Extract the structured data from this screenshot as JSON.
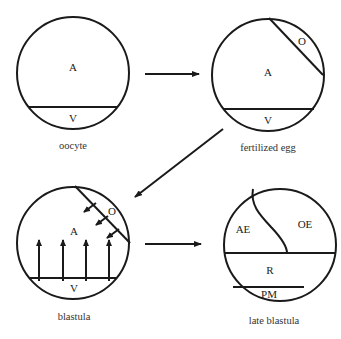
{
  "diagram": {
    "stages": [
      {
        "caption": "oocyte",
        "regions": {
          "animal": "A",
          "vegetal": "V"
        }
      },
      {
        "caption": "fertilized egg",
        "regions": {
          "animal": "A",
          "vegetal": "V",
          "other": "O"
        }
      },
      {
        "caption": "blastula",
        "regions": {
          "animal": "A",
          "vegetal": "V",
          "other": "O"
        }
      },
      {
        "caption": "late blastula",
        "regions": {
          "ae": "AE",
          "oe": "OE",
          "r": "R",
          "pm": "PM"
        }
      }
    ]
  }
}
